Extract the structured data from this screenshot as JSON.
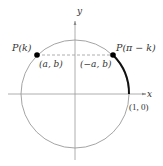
{
  "diagram": {
    "axes": {
      "x_label": "x",
      "y_label": "y"
    },
    "points": [
      {
        "name": "P(k)",
        "label": "P(k)",
        "coords": "(a, b)"
      },
      {
        "name": "P(pi - k)",
        "label": "P(π − k)",
        "coords": "(−a, b)"
      }
    ],
    "intercept_label": "(1, 0)",
    "colors": {
      "circle": "#9a9a9a",
      "axes": "#9a9a9a",
      "arc": "#111111",
      "points": "#000000",
      "dashed": "#9a9a9a",
      "text": "#333333"
    }
  }
}
